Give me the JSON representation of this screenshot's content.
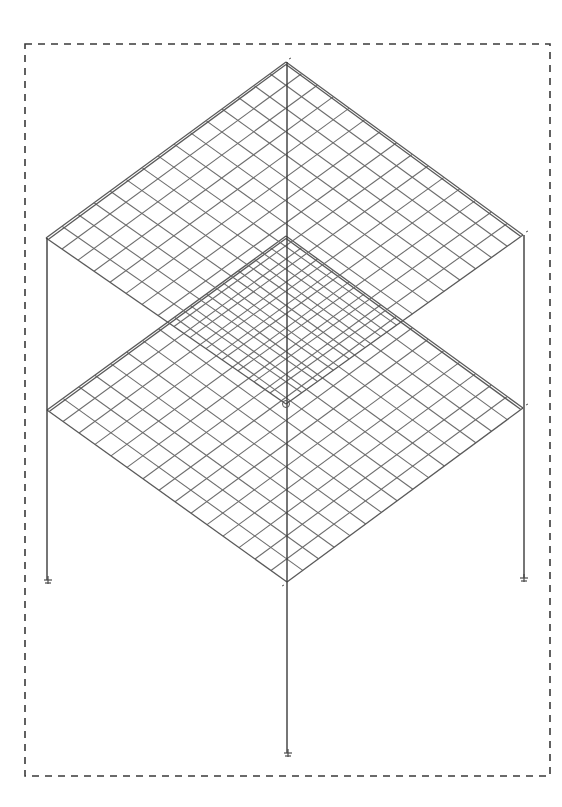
{
  "diagram": {
    "frame_border": {
      "x1": 25,
      "y1": 44,
      "x2": 550,
      "y2": 776,
      "style": "dashed"
    },
    "mesh_divisions": 15,
    "slabs": [
      {
        "name": "upper-slab",
        "level": 2,
        "corners": {
          "top": [
            286,
            62
          ],
          "right": [
            523,
            235
          ],
          "bottom": [
            286,
            404
          ],
          "left": [
            46,
            238
          ]
        }
      },
      {
        "name": "lower-slab",
        "level": 1,
        "corners": {
          "top": [
            286,
            236
          ],
          "right": [
            523,
            408
          ],
          "bottom": [
            287,
            582
          ],
          "left": [
            47,
            410
          ]
        }
      }
    ],
    "columns": [
      {
        "name": "left-column",
        "x": 47,
        "y_top": 238,
        "y_bottom": 580
      },
      {
        "name": "right-column",
        "x": 524,
        "y_top": 235,
        "y_bottom": 578
      },
      {
        "name": "center-column",
        "x": 287,
        "y_top": 62,
        "y_bottom": 753
      }
    ],
    "supports": [
      {
        "name": "left-support",
        "x": 48,
        "y": 580,
        "type": "pinned"
      },
      {
        "name": "right-support",
        "x": 524,
        "y": 578,
        "type": "pinned"
      },
      {
        "name": "center-support",
        "x": 288,
        "y": 753,
        "type": "pinned"
      }
    ],
    "colors": {
      "background": "#ffffff",
      "mesh": "#6e6e6e",
      "column": "#3c3c3c",
      "frame": "#3a3a3a"
    }
  }
}
